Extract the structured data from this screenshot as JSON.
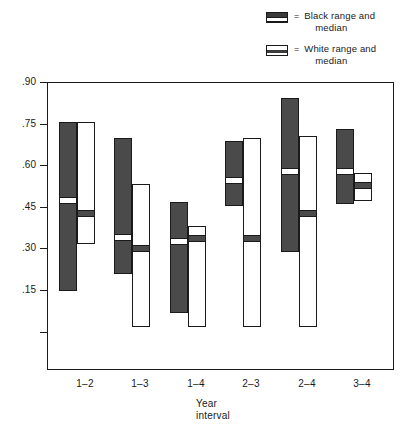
{
  "legend": {
    "equals": "=",
    "items": [
      {
        "swatch": "black-range-swatch",
        "line1": "Black range and",
        "line2": "median"
      },
      {
        "swatch": "white-range-swatch",
        "line1": "White range and",
        "line2": "median"
      }
    ]
  },
  "chart_data": {
    "type": "bar",
    "title": "",
    "xlabel_line1": "Year",
    "xlabel_line2": "interval",
    "ylabel": "Correlation",
    "categories": [
      "1–2",
      "1–3",
      "1–4",
      "2–3",
      "2–4",
      "3–4"
    ],
    "yticks": [
      ".90",
      ".75",
      ".60",
      ".45",
      ".30",
      ".15",
      ""
    ],
    "ytick_values": [
      0.9,
      0.75,
      0.6,
      0.45,
      0.3,
      0.15,
      0.0
    ],
    "ylim": [
      -0.05,
      0.93
    ],
    "grid": false,
    "legend_position": "above-plot-right",
    "series": [
      {
        "name": "Black range and median",
        "color": "#4a4a4a",
        "values": [
          {
            "category": "1–2",
            "low": 0.15,
            "high": 0.76,
            "median": 0.48
          },
          {
            "category": "1–3",
            "low": 0.21,
            "high": 0.7,
            "median": 0.35
          },
          {
            "category": "1–4",
            "low": 0.07,
            "high": 0.47,
            "median": 0.335
          },
          {
            "category": "2–3",
            "low": 0.455,
            "high": 0.69,
            "median": 0.555
          },
          {
            "category": "2–4",
            "low": 0.29,
            "high": 0.845,
            "median": 0.585
          },
          {
            "category": "3–4",
            "low": 0.465,
            "high": 0.735,
            "median": 0.585
          }
        ]
      },
      {
        "name": "White range and median",
        "color": "#ffffff",
        "values": [
          {
            "category": "1–2",
            "low": 0.32,
            "high": 0.76,
            "median": 0.435
          },
          {
            "category": "1–3",
            "low": 0.02,
            "high": 0.535,
            "median": 0.31
          },
          {
            "category": "1–4",
            "low": 0.02,
            "high": 0.385,
            "median": 0.345
          },
          {
            "category": "2–3",
            "low": 0.02,
            "high": 0.7,
            "median": 0.345
          },
          {
            "category": "2–4",
            "low": 0.02,
            "high": 0.71,
            "median": 0.435
          },
          {
            "category": "3–4",
            "low": 0.475,
            "high": 0.575,
            "median": 0.535
          }
        ]
      }
    ]
  }
}
